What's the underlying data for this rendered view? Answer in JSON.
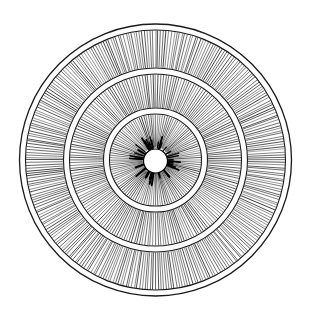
{
  "image": {
    "description": "Black-and-white line engraving of concentric circular rings filled with dense radial hatching around a small white center hole",
    "background": "#ffffff",
    "ink": "#1a1a1a"
  },
  "figure": {
    "center": [
      155.5,
      160
    ],
    "outer_border_radius": 136,
    "center_hole_radius": 12,
    "bands": [
      {
        "name": "inner-band",
        "r_inner": 12,
        "r_outer": 46,
        "lines": 120
      },
      {
        "name": "middle-band",
        "r_inner": 52,
        "r_outer": 86,
        "lines": 200
      },
      {
        "name": "outer-band",
        "r_inner": 92,
        "r_outer": 130,
        "lines": 300
      }
    ],
    "ring_strokes": [
      46,
      52,
      86,
      92,
      130,
      136
    ]
  }
}
